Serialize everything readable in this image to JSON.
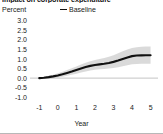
{
  "figure": {
    "title": "Impact on corporate expenditure",
    "background_color": "#ffffff"
  },
  "legend": {
    "position": "top-center",
    "entries": [
      {
        "label": "Baseline",
        "marker": "line-dash-marker",
        "color": "#111111"
      }
    ]
  },
  "axes": {
    "ylabel": "Percent",
    "xlabel": "Year"
  },
  "chart_data": {
    "type": "line",
    "title": "Impact on corporate expenditure",
    "xlabel": "Year",
    "ylabel": "Percent",
    "xlim": [
      -1.5,
      5.4
    ],
    "ylim": [
      -1.25,
      3.25
    ],
    "grid": false,
    "legend_position": "top-center",
    "xticks": [
      -1,
      0,
      1,
      2,
      3,
      4,
      5
    ],
    "xticklabels": [
      "-1",
      "0",
      "1",
      "2",
      "3",
      "4",
      "5"
    ],
    "yticks": [
      3.0,
      2.5,
      2.0,
      1.5,
      1.0,
      0.5,
      0.0,
      -0.5,
      -1.0
    ],
    "yticklabels": [
      "3.0",
      "2.5",
      "2.0",
      "1.5",
      "1.0",
      "0.5",
      "0.0",
      "-0.5",
      "-1.0"
    ],
    "zero_line": 0.0,
    "series": [
      {
        "name": "Baseline",
        "color": "#111111",
        "style": "solid-thick",
        "x": [
          -1.0,
          -0.75,
          -0.5,
          -0.25,
          0.0,
          0.25,
          0.5,
          0.75,
          1.0,
          1.25,
          1.5,
          1.75,
          2.0,
          2.25,
          2.5,
          2.75,
          3.0,
          3.25,
          3.5,
          3.75,
          4.0,
          4.25,
          4.5,
          4.75,
          5.0
        ],
        "values": [
          0.0,
          0.02,
          0.05,
          0.09,
          0.14,
          0.2,
          0.27,
          0.34,
          0.42,
          0.5,
          0.58,
          0.64,
          0.69,
          0.72,
          0.75,
          0.79,
          0.85,
          0.92,
          1.0,
          1.08,
          1.15,
          1.18,
          1.19,
          1.2,
          1.2
        ]
      }
    ],
    "confidence_band": {
      "name": "confidence interval",
      "color": "#d4d4d4",
      "opacity": 0.85,
      "x": [
        -1.0,
        -0.75,
        -0.5,
        -0.25,
        0.0,
        0.25,
        0.5,
        0.75,
        1.0,
        1.25,
        1.5,
        1.75,
        2.0,
        2.25,
        2.5,
        2.75,
        3.0,
        3.25,
        3.5,
        3.75,
        4.0,
        4.25,
        4.5,
        4.75,
        5.0
      ],
      "upper": [
        0.03,
        0.07,
        0.12,
        0.18,
        0.25,
        0.33,
        0.42,
        0.51,
        0.61,
        0.71,
        0.8,
        0.88,
        0.95,
        1.0,
        1.05,
        1.12,
        1.2,
        1.3,
        1.4,
        1.5,
        1.58,
        1.62,
        1.64,
        1.65,
        1.65
      ],
      "lower": [
        -0.03,
        -0.03,
        -0.02,
        0.0,
        0.03,
        0.07,
        0.12,
        0.17,
        0.23,
        0.29,
        0.35,
        0.4,
        0.44,
        0.46,
        0.48,
        0.5,
        0.53,
        0.57,
        0.62,
        0.67,
        0.72,
        0.74,
        0.75,
        0.75,
        0.75
      ]
    }
  }
}
